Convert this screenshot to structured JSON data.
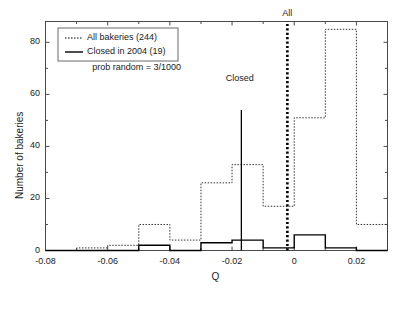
{
  "chart_data": {
    "type": "bar",
    "title": "",
    "xlabel": "Q",
    "ylabel": "Number of bakeries",
    "xlim": [
      -0.08,
      0.03
    ],
    "ylim": [
      0,
      88
    ],
    "bin_width": 0.01,
    "grid": false,
    "xticks": [
      "-0.08",
      "-0.06",
      "-0.04",
      "-0.02",
      "0",
      "0.02"
    ],
    "xtick_values": [
      -0.08,
      -0.06,
      -0.04,
      -0.02,
      0,
      0.02
    ],
    "yticks": [
      "0",
      "20",
      "40",
      "60",
      "80"
    ],
    "ytick_values": [
      0,
      20,
      40,
      60,
      80
    ],
    "bin_edges": [
      -0.08,
      -0.07,
      -0.06,
      -0.05,
      -0.04,
      -0.03,
      -0.02,
      -0.01,
      0,
      0.01,
      0.02,
      0.03
    ],
    "series": [
      {
        "name": "All bakeries (244)",
        "style": "dotted",
        "color": "#333333",
        "values": [
          0,
          1,
          2,
          10,
          4,
          26,
          33,
          17,
          51,
          85,
          10
        ]
      },
      {
        "name": "Closed in 2004 (19)",
        "style": "solid",
        "color": "#000000",
        "values": [
          0,
          0,
          0,
          2,
          0,
          3,
          4,
          1,
          6,
          1,
          0
        ]
      }
    ],
    "markers": [
      {
        "label": "Closed",
        "x": -0.017,
        "height": 54,
        "style": "solid",
        "label_x": -0.0175,
        "label_y": 66
      },
      {
        "label": "All",
        "x": -0.0022,
        "height": 88,
        "style": "dotted-thick",
        "label_x": -0.0022,
        "label_y": 91
      }
    ],
    "annotations": [
      {
        "text": "prob random = 3/1000",
        "x": -0.0695,
        "y": 70
      }
    ],
    "legend": {
      "position": "top-left",
      "entries": [
        {
          "label": "All bakeries (244)",
          "style": "dotted"
        },
        {
          "label": "Closed in 2004 (19)",
          "style": "solid"
        }
      ]
    }
  }
}
